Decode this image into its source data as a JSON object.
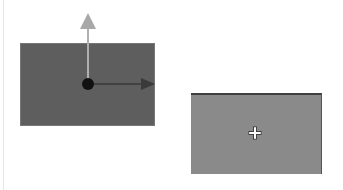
{
  "canvas": {
    "width": 343,
    "height": 190,
    "background": "#ffffff"
  },
  "objects": [
    {
      "id": "rect-a",
      "role": "selected-object",
      "color": "#5e5e5e",
      "x": 20,
      "y": 43,
      "w": 135,
      "h": 83
    },
    {
      "id": "rect-b",
      "role": "target-object",
      "color": "#8a8a8a",
      "x": 191,
      "y": 93,
      "w": 131,
      "h": 81
    }
  ],
  "gizmo": {
    "pivot": {
      "x": 88,
      "y": 84,
      "color": "#111111"
    },
    "y_axis": {
      "to_y": 13,
      "color": "#a8a8a8"
    },
    "x_axis": {
      "to_x": 155,
      "color": "#3a3a3a"
    }
  },
  "cursor": {
    "type": "move-crosshair",
    "x": 255,
    "y": 133
  }
}
